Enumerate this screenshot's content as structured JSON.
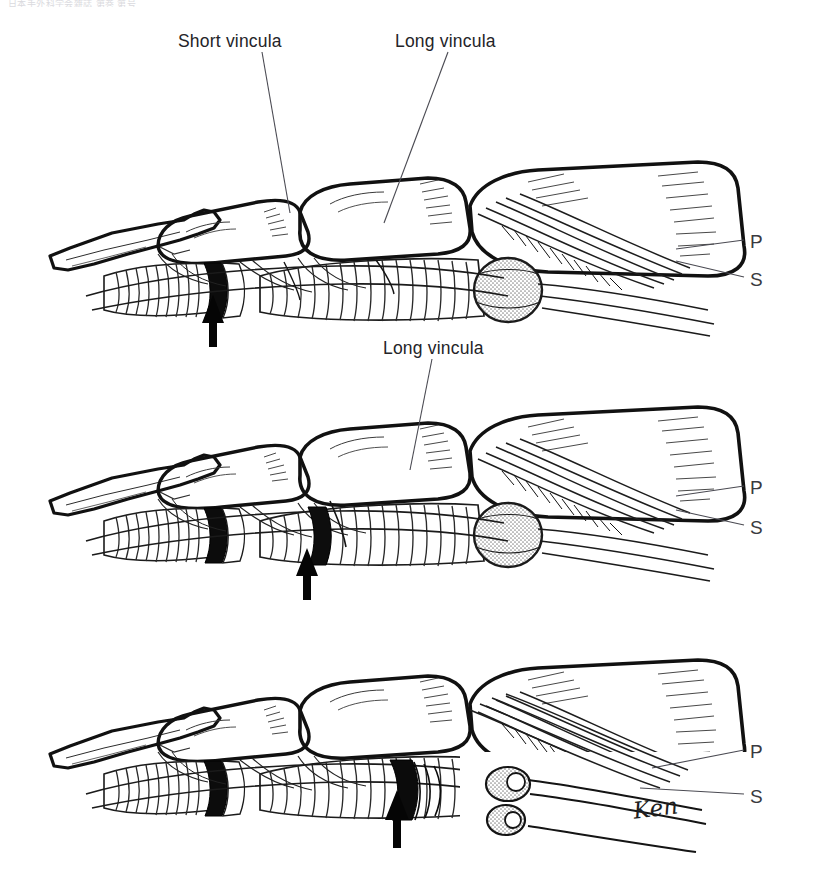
{
  "document": {
    "header_text": "日本手外科学会雑誌  第巻 第号",
    "kind": "medical-line-illustration",
    "subject": "Finger flexor tendon, vincula and tendon laceration levels"
  },
  "signature": {
    "text": "Ken"
  },
  "panels": [
    {
      "id": "panel-top",
      "index": 1,
      "callouts": [
        {
          "name": "short-vincula",
          "text": "Short vincula",
          "x": 178,
          "y": 31,
          "leader": {
            "x1": 262,
            "y1": 52,
            "x2": 290,
            "y2": 213
          }
        },
        {
          "name": "long-vincula",
          "text": "Long vincula",
          "x": 395,
          "y": 31,
          "leader": {
            "x1": 448,
            "y1": 52,
            "x2": 384,
            "y2": 223
          }
        }
      ],
      "side_labels": [
        {
          "name": "profundus",
          "text": "P",
          "x": 750,
          "y": 231,
          "leader": {
            "x1": 676,
            "y1": 249,
            "x2": 744,
            "y2": 240
          }
        },
        {
          "name": "superficialis",
          "text": "S",
          "x": 750,
          "y": 269,
          "leader": {
            "x1": 676,
            "y1": 261,
            "x2": 744,
            "y2": 277
          }
        }
      ],
      "arrow": {
        "name": "lesion-arrow",
        "x": 213,
        "y": 295,
        "height": 52,
        "points_to": "distal A4 / short vincula level"
      }
    },
    {
      "id": "panel-middle",
      "index": 2,
      "callouts": [
        {
          "name": "long-vincula",
          "text": "Long vincula",
          "x": 383,
          "y": 338,
          "leader": {
            "x1": 432,
            "y1": 359,
            "x2": 410,
            "y2": 470
          }
        }
      ],
      "side_labels": [
        {
          "name": "profundus",
          "text": "P",
          "x": 750,
          "y": 477,
          "leader": {
            "x1": 676,
            "y1": 496,
            "x2": 744,
            "y2": 486
          }
        },
        {
          "name": "superficialis",
          "text": "S",
          "x": 750,
          "y": 517,
          "leader": {
            "x1": 676,
            "y1": 510,
            "x2": 744,
            "y2": 525
          }
        }
      ],
      "arrow": {
        "name": "lesion-arrow",
        "x": 307,
        "y": 548,
        "height": 52,
        "points_to": "mid A2 / long vincula level"
      }
    },
    {
      "id": "panel-bottom",
      "index": 3,
      "callouts": [],
      "side_labels": [
        {
          "name": "profundus",
          "text": "P",
          "x": 750,
          "y": 741,
          "leader": {
            "x1": 652,
            "y1": 768,
            "x2": 744,
            "y2": 750
          }
        },
        {
          "name": "superficialis",
          "text": "S",
          "x": 750,
          "y": 786,
          "leader": {
            "x1": 640,
            "y1": 788,
            "x2": 744,
            "y2": 794
          }
        }
      ],
      "arrow": {
        "name": "lesion-arrow",
        "x": 397,
        "y": 790,
        "height": 58,
        "points_to": "proximal phalanx / retracted tendon level"
      }
    }
  ],
  "colors": {
    "ink": "#111111",
    "paper": "#ffffff",
    "stipple": "#9a9a9a",
    "leader": "#4a4a52",
    "label": "#242428"
  }
}
